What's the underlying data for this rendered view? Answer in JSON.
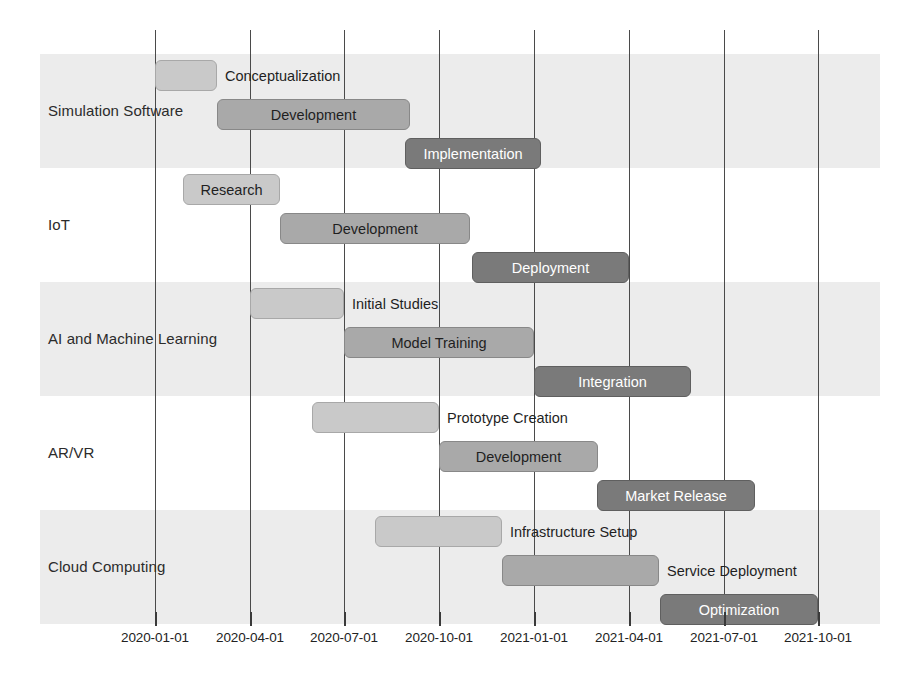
{
  "chart_data": {
    "type": "bar",
    "chart_kind": "gantt",
    "title": "",
    "xlabel": "",
    "ylabel": "",
    "grid": true,
    "legend": false,
    "x_axis": {
      "type": "date",
      "range": [
        "2020-01-01",
        "2021-10-01"
      ],
      "tick_labels": [
        "2020-01-01",
        "2020-04-01",
        "2020-07-01",
        "2020-10-01",
        "2021-01-01",
        "2021-04-01",
        "2021-07-01",
        "2021-10-01"
      ],
      "tick_positions_px": [
        155,
        250,
        344,
        439,
        534,
        629,
        724,
        818
      ],
      "px_per_quarter": 94.7
    },
    "categories": [
      "Simulation Software",
      "IoT",
      "AI and Machine Learning",
      "AR/VR",
      "Cloud Computing"
    ],
    "shades": {
      "light": "#c9c9c9",
      "mid": "#a9a9a9",
      "dark": "#7a7a7a",
      "band": "#ececec",
      "gridline": "#4a4a4a"
    },
    "rows": [
      {
        "category": "Simulation Software",
        "band_shaded": true,
        "tasks": [
          {
            "label": "Conceptualization",
            "start": "2020-01-01",
            "end": "2020-03-01",
            "shade": "light",
            "label_position": "outside-right",
            "x": 155,
            "w": 62,
            "y": 60
          },
          {
            "label": "Development",
            "start": "2020-03-01",
            "end": "2020-09-01",
            "shade": "mid",
            "label_position": "inside",
            "x": 217,
            "w": 193,
            "y": 99
          },
          {
            "label": "Implementation",
            "start": "2020-09-01",
            "end": "2021-01-15",
            "shade": "dark",
            "label_position": "inside",
            "x": 405,
            "w": 136,
            "y": 138
          }
        ]
      },
      {
        "category": "IoT",
        "band_shaded": false,
        "tasks": [
          {
            "label": "Research",
            "start": "2020-02-01",
            "end": "2020-05-01",
            "shade": "light",
            "label_position": "inside",
            "x": 183,
            "w": 97,
            "y": 174
          },
          {
            "label": "Development",
            "start": "2020-05-01",
            "end": "2020-11-01",
            "shade": "mid",
            "label_position": "inside",
            "x": 280,
            "w": 190,
            "y": 213
          },
          {
            "label": "Deployment",
            "start": "2020-11-01",
            "end": "2021-04-01",
            "shade": "dark",
            "label_position": "inside",
            "x": 472,
            "w": 157,
            "y": 252
          }
        ]
      },
      {
        "category": "AI and Machine Learning",
        "band_shaded": true,
        "tasks": [
          {
            "label": "Initial Studies",
            "start": "2020-04-01",
            "end": "2020-07-01",
            "shade": "light",
            "label_position": "outside-right",
            "x": 250,
            "w": 94,
            "y": 288
          },
          {
            "label": "Model Training",
            "start": "2020-07-01",
            "end": "2021-01-01",
            "shade": "mid",
            "label_position": "inside",
            "x": 344,
            "w": 190,
            "y": 327
          },
          {
            "label": "Integration",
            "start": "2021-01-01",
            "end": "2021-06-01",
            "shade": "dark",
            "label_position": "inside",
            "x": 534,
            "w": 157,
            "y": 366
          }
        ]
      },
      {
        "category": "AR/VR",
        "band_shaded": false,
        "tasks": [
          {
            "label": "Prototype Creation",
            "start": "2020-06-01",
            "end": "2020-11-01",
            "shade": "light",
            "label_position": "outside-right",
            "x": 312,
            "w": 127,
            "y": 402
          },
          {
            "label": "Development",
            "start": "2020-10-01",
            "end": "2021-03-01",
            "shade": "mid",
            "label_position": "inside",
            "x": 439,
            "w": 159,
            "y": 441
          },
          {
            "label": "Market Release",
            "start": "2021-04-01",
            "end": "2021-09-01",
            "shade": "dark",
            "label_position": "inside",
            "x": 597,
            "w": 158,
            "y": 480
          }
        ]
      },
      {
        "category": "Cloud Computing",
        "band_shaded": true,
        "tasks": [
          {
            "label": "Infrastructure Setup",
            "start": "2020-08-01",
            "end": "2020-12-01",
            "shade": "light",
            "label_position": "outside-right",
            "x": 375,
            "w": 127,
            "y": 516
          },
          {
            "label": "Service Deployment",
            "start": "2020-12-01",
            "end": "2021-05-01",
            "shade": "mid",
            "label_position": "outside-right",
            "x": 502,
            "w": 157,
            "y": 555
          },
          {
            "label": "Optimization",
            "start": "2021-05-01",
            "end": "2021-10-01",
            "shade": "dark",
            "label_position": "inside",
            "x": 660,
            "w": 158,
            "y": 594
          }
        ]
      }
    ]
  }
}
